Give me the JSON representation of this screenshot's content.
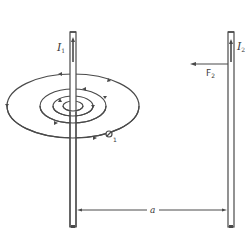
{
  "figure": {
    "colors": {
      "line": "#4a4a4a",
      "background": "#ffffff"
    },
    "wire1": {
      "current_label": "I",
      "current_subscript": "1",
      "current_direction": "up"
    },
    "wire2": {
      "current_label": "I",
      "current_subscript": "2",
      "current_direction": "up"
    },
    "force": {
      "label": "F",
      "subscript": "2",
      "direction": "left"
    },
    "field": {
      "label": "B",
      "subscript": "1",
      "rings": 4,
      "circulation": "counterclockwise-viewed-from-above"
    },
    "separation": {
      "label": "a"
    }
  }
}
